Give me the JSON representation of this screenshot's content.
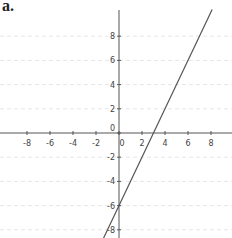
{
  "panel_label": "a.",
  "chart_data": {
    "type": "line",
    "title": "",
    "xlabel": "",
    "ylabel": "",
    "xlim": [
      -10,
      10
    ],
    "ylim": [
      -9,
      10
    ],
    "grid": true,
    "x_ticks": [
      -8,
      -6,
      -4,
      -2,
      0,
      2,
      4,
      6,
      8
    ],
    "y_ticks": [
      -8,
      -6,
      -4,
      -2,
      0,
      2,
      4,
      6,
      8
    ],
    "series": [
      {
        "name": "y = 2x - 6",
        "x": [
          -1.5,
          8.1
        ],
        "y": [
          -9,
          10.2
        ],
        "color": "#555555"
      }
    ],
    "annotations": [
      "x-intercept at 3",
      "y-intercept at -6"
    ]
  }
}
